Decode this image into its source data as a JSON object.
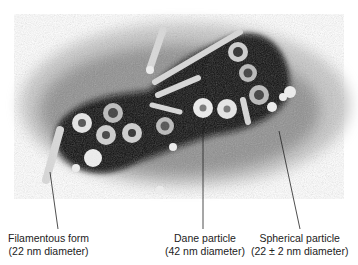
{
  "figure": {
    "type": "electron-micrograph",
    "labels": [
      {
        "id": "filamentous",
        "line1": "Filamentous form",
        "line2": "(22 nm diameter)"
      },
      {
        "id": "dane",
        "line1": "Dane particle",
        "line2": "(42 nm diameter)"
      },
      {
        "id": "spherical",
        "line1": "Spherical particle",
        "line2": "(22 ± 2 nm diameter)"
      }
    ]
  },
  "colors": {
    "background": "#ffffff",
    "stain_dark": "#111111",
    "particle_light": "#e8e8e8",
    "text": "#222222"
  }
}
